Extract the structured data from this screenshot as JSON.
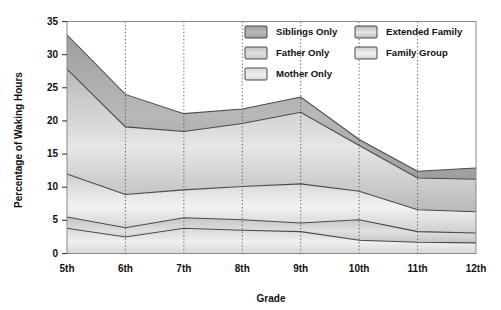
{
  "chart_data": {
    "type": "area",
    "title": "",
    "subtitle": "",
    "xlabel": "Grade",
    "ylabel": "Percentage of Waking Hours",
    "categories": [
      "5th",
      "6th",
      "7th",
      "8th",
      "9th",
      "10th",
      "11th",
      "12th"
    ],
    "x": [
      5,
      6,
      7,
      8,
      9,
      10,
      11,
      12
    ],
    "ylim": [
      0,
      35
    ],
    "yticks": [
      0,
      5,
      10,
      15,
      20,
      25,
      30,
      35
    ],
    "ytick_labels": [
      "0",
      "5",
      "10",
      "15",
      "20",
      "25",
      "30",
      "35"
    ],
    "xtick_labels": [
      "5th",
      "6th",
      "7th",
      "8th",
      "9th",
      "10th",
      "11th",
      "12th"
    ],
    "grid": "vertical-dotted",
    "stacked": true,
    "legend_position": "top-right-inside",
    "series": [
      {
        "name": "Mother Only",
        "values": [
          3.8,
          2.5,
          3.8,
          3.5,
          3.3,
          2.0,
          1.7,
          1.6
        ],
        "cumulative_top": [
          3.8,
          2.5,
          3.8,
          3.5,
          3.3,
          2.0,
          1.7,
          1.6
        ],
        "color": "#efefef",
        "color_dark": "#d8d8d8",
        "stack_order": 1
      },
      {
        "name": "Father Only",
        "values": [
          1.7,
          1.4,
          1.6,
          1.6,
          1.3,
          3.1,
          1.6,
          1.5
        ],
        "cumulative_top": [
          5.5,
          3.9,
          5.4,
          5.1,
          4.6,
          5.1,
          3.3,
          3.1
        ],
        "color": "#e0e0e0",
        "color_dark": "#c4c4c4",
        "stack_order": 2
      },
      {
        "name": "Family Group",
        "values": [
          6.5,
          5.0,
          4.2,
          5.0,
          5.9,
          4.3,
          3.3,
          3.2
        ],
        "cumulative_top": [
          12.0,
          8.9,
          9.6,
          10.1,
          10.5,
          9.4,
          6.6,
          6.3
        ],
        "color": "#f2f2f2",
        "color_dark": "#cfcfcf",
        "stack_order": 3
      },
      {
        "name": "Extended Family",
        "values": [
          15.8,
          10.2,
          8.8,
          9.5,
          10.8,
          6.9,
          4.8,
          4.9
        ],
        "cumulative_top": [
          27.8,
          19.1,
          18.4,
          19.6,
          21.3,
          16.3,
          11.4,
          11.2
        ],
        "color": "#e6e6e6",
        "color_dark": "#b9b9b9",
        "stack_order": 4
      },
      {
        "name": "Siblings Only",
        "values": [
          5.2,
          4.9,
          2.7,
          2.2,
          2.3,
          0.9,
          1.0,
          1.7
        ],
        "cumulative_top": [
          33.0,
          24.0,
          21.1,
          21.8,
          23.6,
          17.2,
          12.4,
          12.9
        ],
        "color": "#b8b8b8",
        "color_dark": "#9e9e9e",
        "stack_order": 5
      }
    ],
    "legend": [
      {
        "label": "Siblings Only",
        "column": 0,
        "row": 0
      },
      {
        "label": "Father Only",
        "column": 0,
        "row": 1
      },
      {
        "label": "Mother Only",
        "column": 0,
        "row": 2
      },
      {
        "label": "Extended Family",
        "column": 1,
        "row": 0
      },
      {
        "label": "Family Group",
        "column": 1,
        "row": 1
      }
    ]
  },
  "colors": {
    "background": "#ffffff",
    "frame": "#8a8a8a",
    "gridline": "#555555",
    "band_edge": "#4a4a4a",
    "text": "#111111"
  }
}
